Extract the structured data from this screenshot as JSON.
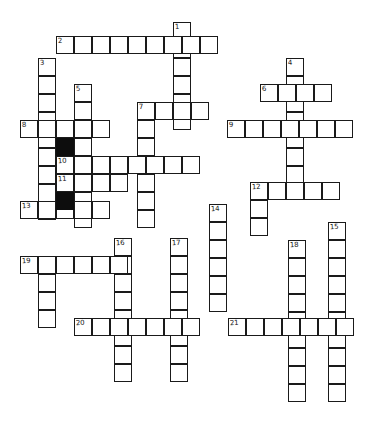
{
  "puzzle": {
    "type": "crossword-grid",
    "title": "Blank crossword puzzle grid",
    "width": 380,
    "height": 434,
    "cell_size": 18,
    "colors": {
      "cell_fill": "#ffffff",
      "cell_stroke": "#1a1a1a",
      "blocked_fill": "#0d0d0d",
      "number_text": "#141414",
      "background": "#ffffff"
    },
    "entries": [
      {
        "number": "1",
        "direction": "down",
        "x": 173,
        "y": 22,
        "length": 6
      },
      {
        "number": "2",
        "direction": "across",
        "x": 56,
        "y": 36,
        "length": 9
      },
      {
        "number": "3",
        "direction": "down",
        "x": 38,
        "y": 58,
        "length": 9
      },
      {
        "number": "4",
        "direction": "down",
        "x": 286,
        "y": 58,
        "length": 7
      },
      {
        "number": "5",
        "direction": "down",
        "x": 74,
        "y": 84,
        "length": 8
      },
      {
        "number": "6",
        "direction": "across",
        "x": 260,
        "y": 84,
        "length": 4
      },
      {
        "number": "7",
        "direction": "down",
        "x": 137,
        "y": 102,
        "length": 7
      },
      {
        "number": "8",
        "direction": "across",
        "x": 20,
        "y": 120,
        "length": 5
      },
      {
        "number": "9",
        "direction": "across",
        "x": 227,
        "y": 120,
        "length": 7
      },
      {
        "number": "10",
        "direction": "across",
        "x": 56,
        "y": 156,
        "length": 8
      },
      {
        "number": "11",
        "direction": "across",
        "x": 56,
        "y": 174,
        "length": 4
      },
      {
        "number": "12",
        "direction": "across",
        "x": 250,
        "y": 182,
        "length": 5
      },
      {
        "number": "13",
        "direction": "across",
        "x": 20,
        "y": 201,
        "length": 5
      },
      {
        "number": "14",
        "direction": "down",
        "x": 209,
        "y": 204,
        "length": 6
      },
      {
        "number": "15",
        "direction": "down",
        "x": 328,
        "y": 222,
        "length": 10
      },
      {
        "number": "16",
        "direction": "down",
        "x": 114,
        "y": 238,
        "length": 8
      },
      {
        "number": "17",
        "direction": "down",
        "x": 170,
        "y": 238,
        "length": 8
      },
      {
        "number": "18",
        "direction": "down",
        "x": 288,
        "y": 240,
        "length": 9
      },
      {
        "number": "19",
        "direction": "across",
        "x": 20,
        "y": 256,
        "length": 6
      },
      {
        "number": "20",
        "direction": "across",
        "x": 74,
        "y": 318,
        "length": 7
      },
      {
        "number": "21",
        "direction": "across",
        "x": 228,
        "y": 318,
        "length": 7
      }
    ],
    "white_cells": [
      [
        173,
        22
      ],
      [
        173,
        40
      ],
      [
        56,
        36
      ],
      [
        74,
        36
      ],
      [
        92,
        36
      ],
      [
        110,
        36
      ],
      [
        128,
        36
      ],
      [
        146,
        36
      ],
      [
        164,
        36
      ],
      [
        182,
        36
      ],
      [
        200,
        36
      ],
      [
        38,
        58
      ],
      [
        38,
        76
      ],
      [
        38,
        94
      ],
      [
        38,
        112
      ],
      [
        38,
        130
      ],
      [
        38,
        148
      ],
      [
        286,
        58
      ],
      [
        286,
        76
      ],
      [
        286,
        94
      ],
      [
        286,
        112
      ],
      [
        286,
        130
      ],
      [
        286,
        148
      ],
      [
        286,
        166
      ],
      [
        74,
        84
      ],
      [
        74,
        102
      ],
      [
        74,
        120
      ],
      [
        260,
        84
      ],
      [
        278,
        84
      ],
      [
        296,
        84
      ],
      [
        314,
        84
      ],
      [
        137,
        102
      ],
      [
        155,
        102
      ],
      [
        173,
        102
      ],
      [
        191,
        102
      ],
      [
        137,
        120
      ],
      [
        137,
        138
      ],
      [
        137,
        156
      ],
      [
        137,
        174
      ],
      [
        137,
        192
      ],
      [
        20,
        120
      ],
      [
        38,
        120
      ],
      [
        56,
        120
      ],
      [
        74,
        120
      ],
      [
        92,
        120
      ],
      [
        227,
        120
      ],
      [
        245,
        120
      ],
      [
        263,
        120
      ],
      [
        281,
        120
      ],
      [
        299,
        120
      ],
      [
        317,
        120
      ],
      [
        335,
        120
      ],
      [
        56,
        156
      ],
      [
        74,
        156
      ],
      [
        92,
        156
      ],
      [
        110,
        156
      ],
      [
        128,
        156
      ],
      [
        146,
        156
      ],
      [
        164,
        156
      ],
      [
        182,
        156
      ],
      [
        56,
        174
      ],
      [
        74,
        174
      ],
      [
        92,
        174
      ],
      [
        110,
        174
      ],
      [
        250,
        182
      ],
      [
        268,
        182
      ],
      [
        286,
        182
      ],
      [
        304,
        182
      ],
      [
        322,
        182
      ],
      [
        20,
        201
      ],
      [
        38,
        201
      ],
      [
        56,
        201
      ],
      [
        74,
        201
      ],
      [
        92,
        201
      ],
      [
        209,
        204
      ],
      [
        209,
        222
      ],
      [
        209,
        240
      ],
      [
        209,
        258
      ],
      [
        209,
        276
      ],
      [
        328,
        222
      ],
      [
        328,
        240
      ],
      [
        328,
        258
      ],
      [
        328,
        276
      ],
      [
        328,
        294
      ],
      [
        328,
        312
      ],
      [
        328,
        330
      ],
      [
        328,
        348
      ],
      [
        328,
        366
      ],
      [
        328,
        384
      ],
      [
        114,
        238
      ],
      [
        114,
        256
      ],
      [
        114,
        274
      ],
      [
        114,
        292
      ],
      [
        114,
        310
      ],
      [
        114,
        328
      ],
      [
        114,
        346
      ],
      [
        170,
        238
      ],
      [
        170,
        256
      ],
      [
        170,
        274
      ],
      [
        170,
        292
      ],
      [
        170,
        310
      ],
      [
        170,
        328
      ],
      [
        170,
        346
      ],
      [
        288,
        240
      ],
      [
        288,
        258
      ],
      [
        288,
        276
      ],
      [
        288,
        294
      ],
      [
        288,
        312
      ],
      [
        288,
        330
      ],
      [
        288,
        348
      ],
      [
        288,
        366
      ],
      [
        288,
        384
      ],
      [
        20,
        256
      ],
      [
        38,
        256
      ],
      [
        56,
        256
      ],
      [
        74,
        256
      ],
      [
        92,
        256
      ],
      [
        110,
        256
      ],
      [
        38,
        274
      ],
      [
        38,
        292
      ],
      [
        38,
        310
      ],
      [
        74,
        318
      ],
      [
        92,
        318
      ],
      [
        110,
        318
      ],
      [
        128,
        318
      ],
      [
        146,
        318
      ],
      [
        164,
        318
      ],
      [
        182,
        318
      ],
      [
        228,
        318
      ],
      [
        246,
        318
      ],
      [
        264,
        318
      ],
      [
        282,
        318
      ],
      [
        300,
        318
      ],
      [
        318,
        318
      ],
      [
        336,
        318
      ],
      [
        250,
        200
      ],
      [
        250,
        218
      ]
    ],
    "black_cells": [
      [
        56,
        138
      ],
      [
        56,
        192
      ]
    ]
  }
}
